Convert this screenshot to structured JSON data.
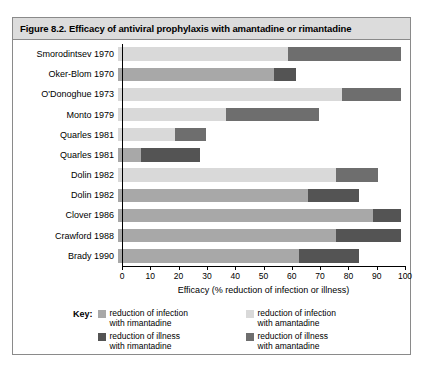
{
  "figure": {
    "title": "Figure 8.2. Efficacy of antiviral prophylaxis with amantadine or rimantadine"
  },
  "colors": {
    "infection_rimantadine": "#a8a8a8",
    "infection_amantadine": "#d9d9d9",
    "illness_rimantadine": "#545454",
    "illness_amantadine": "#6e6e6e",
    "axis": "#000000",
    "header_band": "#dcdcdc",
    "frame_border": "#8a8a8a"
  },
  "legend": {
    "key_label": "Key:",
    "entries": [
      {
        "label_line1": "reduction of infection",
        "label_line2": "with rimantadine",
        "color": "#a8a8a8",
        "series": "infection_rimantadine",
        "column": 0
      },
      {
        "label_line1": "reduction of illness",
        "label_line2": "with rimantadine",
        "color": "#545454",
        "series": "illness_rimantadine",
        "column": 0
      },
      {
        "label_line1": "reduction of infection",
        "label_line2": "with amantadine",
        "color": "#d9d9d9",
        "series": "infection_amantadine",
        "column": 1
      },
      {
        "label_line1": "reduction of illness",
        "label_line2": "with amantadine",
        "color": "#6e6e6e",
        "series": "illness_amantadine",
        "column": 1
      }
    ]
  },
  "chart_data": {
    "type": "bar",
    "orientation": "horizontal",
    "stacked": true,
    "title": "Efficacy of antiviral prophylaxis with amantadine or rimantadine",
    "xlabel": "Efficacy (% reduction of infection or illness)",
    "ylabel": "",
    "xlim": [
      0,
      100
    ],
    "xticks": [
      0,
      10,
      20,
      30,
      40,
      50,
      60,
      70,
      80,
      90,
      100
    ],
    "grid": false,
    "legend_position": "bottom",
    "categories": [
      "Smorodintsev 1970",
      "Oker-Blom 1970",
      "O'Donoghue 1973",
      "Monto 1979",
      "Quarles 1981",
      "Quarles 1981",
      "Dolin 1982",
      "Dolin 1982",
      "Clover 1986",
      "Crawford 1988",
      "Brady 1990"
    ],
    "bars": [
      {
        "category": "Smorodintsev 1970",
        "drug": "amantadine",
        "infection": 60,
        "illness": 100
      },
      {
        "category": "Oker-Blom 1970",
        "drug": "rimantadine",
        "infection": 55,
        "illness": 63
      },
      {
        "category": "O'Donoghue 1973",
        "drug": "amantadine",
        "infection": 79,
        "illness": 100
      },
      {
        "category": "Monto 1979",
        "drug": "amantadine",
        "infection": 38,
        "illness": 71
      },
      {
        "category": "Quarles 1981",
        "drug": "amantadine",
        "infection": 20,
        "illness": 31
      },
      {
        "category": "Quarles 1981",
        "drug": "rimantadine",
        "infection": 8,
        "illness": 29
      },
      {
        "category": "Dolin 1982",
        "drug": "amantadine",
        "infection": 77,
        "illness": 92
      },
      {
        "category": "Dolin 1982",
        "drug": "rimantadine",
        "infection": 67,
        "illness": 85
      },
      {
        "category": "Clover 1986",
        "drug": "rimantadine",
        "infection": 90,
        "illness": 100
      },
      {
        "category": "Crawford 1988",
        "drug": "rimantadine",
        "infection": 77,
        "illness": 100
      },
      {
        "category": "Brady 1990",
        "drug": "rimantadine",
        "infection": 64,
        "illness": 85
      }
    ]
  }
}
